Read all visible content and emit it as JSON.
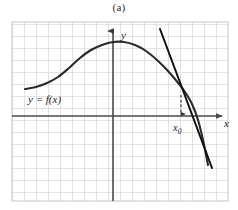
{
  "figure": {
    "caption": "(a)",
    "background_color": "#ffffff",
    "grid_color": "#c9c9d2",
    "axis_color": "#4a4a4a",
    "curve_color": "#2a2a2a",
    "tangent_color": "#111111",
    "dashed_color": "#3a3a3a"
  },
  "labels": {
    "y_axis": "y",
    "x_axis": "x",
    "function": "y = f(x)",
    "tangent_point_base": "x",
    "tangent_point_sub": "0"
  },
  "chart_data": {
    "type": "line",
    "title": "(a)",
    "xlabel": "x",
    "ylabel": "y",
    "grid": true,
    "legend": "none",
    "annotations": [
      {
        "name": "function-label",
        "text": "y = f(x)",
        "x_px": 30,
        "y_px": 100
      },
      {
        "name": "x0-label",
        "text": "x₀",
        "x_px": 176,
        "y_px": 128
      },
      {
        "name": "y-axis-label",
        "text": "y",
        "x_px": 120,
        "y_px": 36
      },
      {
        "name": "x-axis-label",
        "text": "x",
        "x_px": 226,
        "y_px": 125
      }
    ],
    "axes": {
      "origin_px": {
        "x": 113,
        "y": 116
      },
      "x_axis_span_px": {
        "from": 12,
        "to": 228
      },
      "y_axis_span_px": {
        "from": 200,
        "to": 26
      },
      "grid_spacing_px": 12,
      "grid_bounds_px": {
        "left": 12,
        "top": 22,
        "right": 228,
        "bottom": 201
      }
    },
    "series": [
      {
        "name": "f(x)",
        "comment": "smooth hump: rises from left asymptote, peaks near y-axis, falls steeply right",
        "points_px": [
          [
            25,
            89
          ],
          [
            36,
            87
          ],
          [
            47,
            83
          ],
          [
            58,
            77
          ],
          [
            69,
            68
          ],
          [
            80,
            58
          ],
          [
            91,
            50
          ],
          [
            102,
            45
          ],
          [
            113,
            42
          ],
          [
            124,
            42
          ],
          [
            135,
            45
          ],
          [
            146,
            51
          ],
          [
            157,
            60
          ],
          [
            168,
            71
          ],
          [
            179,
            84
          ],
          [
            185,
            92
          ],
          [
            192,
            104
          ],
          [
            198,
            120
          ],
          [
            203,
            140
          ],
          [
            208,
            165
          ]
        ]
      },
      {
        "name": "tangent",
        "comment": "tangent line to f at x0, touching curve near (181,95)",
        "points_px": [
          [
            160,
            29
          ],
          [
            212,
            168
          ]
        ]
      }
    ],
    "tangent_point_px": {
      "x": 181,
      "y": 95
    },
    "dashed_drop_px": {
      "x": 181,
      "y_from": 95,
      "y_to": 114
    }
  }
}
